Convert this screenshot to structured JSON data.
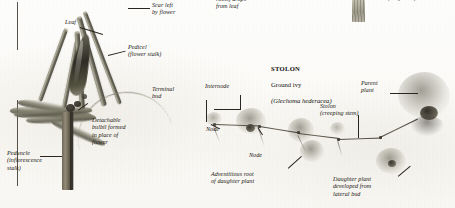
{
  "page": {
    "width": 455,
    "height": 208,
    "background_color": "#fdfdfc",
    "ink_color": "#1a1713"
  },
  "left_panel": {
    "subject": "bulbil-bearing plant (inflorescence with bulbils)",
    "labels": [
      {
        "id": "leaf",
        "text": "Leaf"
      },
      {
        "id": "scar-left-by-flower",
        "text": "Scar left\nby flower"
      },
      {
        "id": "pedicel",
        "text": "Pedicel\n(flower stalk)"
      },
      {
        "id": "detachable-bulbil",
        "text": "Detachable\nbulbil formed\nin place of\nflower"
      },
      {
        "id": "peduncle",
        "text": "Peduncle\n(inflorescence\nstalk)"
      }
    ]
  },
  "top_fragments": {
    "note": "partially cropped text at the top edge of the page",
    "items": [
      {
        "id": "roots-drops-from-leaf",
        "text": "roots) drops\nfrom leaf"
      },
      {
        "id": "twig-stalk",
        "text": "(twig stalk)"
      }
    ]
  },
  "right_panel": {
    "heading": {
      "title": "STOLON",
      "common_name": "Ground ivy",
      "scientific_name": "(Glechoma hederacea)"
    },
    "labels": [
      {
        "id": "terminal-bud",
        "text": "Terminal\nbud"
      },
      {
        "id": "internode",
        "text": "Internode"
      },
      {
        "id": "node-upper",
        "text": "Node"
      },
      {
        "id": "node-lower",
        "text": "Node"
      },
      {
        "id": "adventitious-root",
        "text": "Adventitious root\nof daughter plant"
      },
      {
        "id": "parent-plant",
        "text": "Parent\nplant"
      },
      {
        "id": "stolon-creeping-stem",
        "text": "Stolon\n(creeping stem)"
      },
      {
        "id": "daughter-plant",
        "text": "Daughter plant\ndeveloped from\nlateral bud"
      }
    ]
  }
}
